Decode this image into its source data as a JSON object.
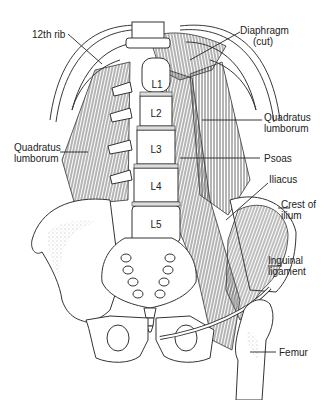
{
  "figure": {
    "labels": {
      "rib12": "12th rib",
      "diaphragm_line1": "Diaphragm",
      "diaphragm_line2": "(cut)",
      "ql_right_line1": "Quadratus",
      "ql_right_line2": "lumborum",
      "ql_left_line1": "Quadratus",
      "ql_left_line2": "lumborum",
      "psoas": "Psoas",
      "iliacus": "Iliacus",
      "crest_line1": "Crest of",
      "crest_line2": "ilium",
      "inguinal_line1": "Inguinal",
      "inguinal_line2": "ligament",
      "femur": "Femur"
    },
    "vertebrae": [
      "L1",
      "L2",
      "L3",
      "L4",
      "L5"
    ],
    "colors": {
      "line": "#222222",
      "background": "#ffffff"
    }
  }
}
